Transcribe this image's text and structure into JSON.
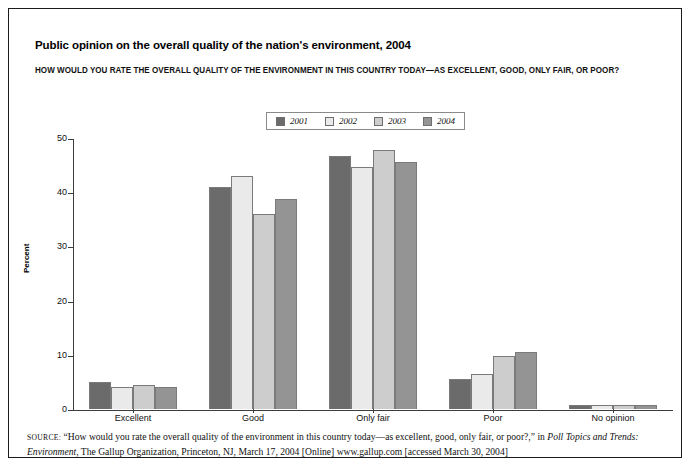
{
  "figure": {
    "title": "Public opinion on the overall quality of the nation's environment, 2004",
    "question": "HOW WOULD YOU RATE THE OVERALL QUALITY OF THE ENVIRONMENT IN THIS COUNTRY TODAY—AS EXCELLENT, GOOD, ONLY FAIR, OR POOR?"
  },
  "source": {
    "label": "SOURCE:",
    "text_part1": " “How would you rate the overall quality of the environment in this country today—as excellent, good, only fair, or poor?,” in ",
    "italic1": "Poll Topics and Trends: Environment",
    "text_part2": ", The Gallup Organization, Princeton, NJ, March 17, 2004 [Online] www.gallup.com [accessed March 30, 2004]"
  },
  "colors": {
    "series_2001": "#6b6b6b",
    "series_2002": "#eaeaea",
    "series_2003": "#cdcdcd",
    "series_2004": "#949494",
    "axis": "#3d3d3d",
    "frame": "#1b1b1b"
  },
  "chart_data": {
    "type": "bar",
    "title": "Public opinion on the overall quality of the nation's environment, 2004",
    "subtitle": "HOW WOULD YOU RATE THE OVERALL QUALITY OF THE ENVIRONMENT IN THIS COUNTRY TODAY—AS EXCELLENT, GOOD, ONLY FAIR, OR POOR?",
    "xlabel": "",
    "ylabel": "Percent",
    "ylim": [
      0,
      50
    ],
    "yticks": [
      0,
      10,
      20,
      30,
      40,
      50
    ],
    "grid": false,
    "legend_position": "top-center",
    "categories": [
      "Excellent",
      "Good",
      "Only fair",
      "Poor",
      "No opinion"
    ],
    "series": [
      {
        "name": "2001",
        "color": "#6b6b6b",
        "values": [
          5.0,
          41.0,
          46.6,
          5.6,
          0.8
        ]
      },
      {
        "name": "2002",
        "color": "#eaeaea",
        "values": [
          4.0,
          43.0,
          44.7,
          6.5,
          0.8
        ]
      },
      {
        "name": "2003",
        "color": "#cdcdcd",
        "values": [
          4.5,
          35.9,
          47.7,
          9.7,
          0.8
        ]
      },
      {
        "name": "2004",
        "color": "#949494",
        "values": [
          4.0,
          38.8,
          45.6,
          10.6,
          0.8
        ]
      }
    ]
  }
}
